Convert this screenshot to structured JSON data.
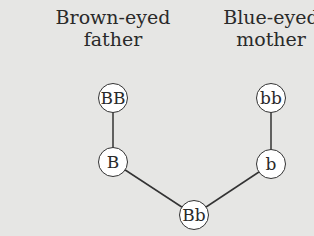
{
  "parents": {
    "father": {
      "line1": "Brown-eyed",
      "line2": "father",
      "genotype": "BB",
      "gamete": "B"
    },
    "mother": {
      "line1": "Blue-eyed",
      "line2": "mother",
      "genotype": "bb",
      "gamete": "b"
    }
  },
  "offspring": {
    "genotype": "Bb"
  },
  "colors": {
    "background": "#e6e6e4",
    "node_fill": "#ffffff",
    "line": "#333333"
  }
}
